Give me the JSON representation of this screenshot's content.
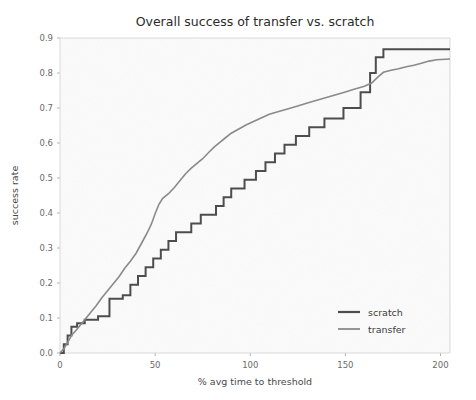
{
  "chart_data": {
    "type": "line",
    "title": "Overall success of transfer vs. scratch",
    "xlabel": "% avg time to threshold",
    "ylabel": "success rate",
    "xlim": [
      0,
      205
    ],
    "ylim": [
      0.0,
      0.9
    ],
    "xticks": [
      0,
      50,
      100,
      150,
      200
    ],
    "xtick_labels": [
      "0",
      "50",
      "100",
      "150",
      "200"
    ],
    "yticks": [
      0.0,
      0.1,
      0.2,
      0.3,
      0.4,
      0.5,
      0.6,
      0.7,
      0.8,
      0.9
    ],
    "ytick_labels": [
      "0.0",
      "0.1",
      "0.2",
      "0.3",
      "0.4",
      "0.5",
      "0.6",
      "0.7",
      "0.8",
      "0.9"
    ],
    "grid": false,
    "legend_position": "lower right",
    "series": [
      {
        "name": "scratch",
        "color": "#4d4d4d",
        "width": 2.0,
        "step": true,
        "points": [
          [
            0,
            0.0
          ],
          [
            2,
            0.0
          ],
          [
            2,
            0.025
          ],
          [
            4,
            0.025
          ],
          [
            4,
            0.05
          ],
          [
            6,
            0.05
          ],
          [
            6,
            0.075
          ],
          [
            9,
            0.075
          ],
          [
            9,
            0.085
          ],
          [
            13,
            0.085
          ],
          [
            13,
            0.095
          ],
          [
            20,
            0.095
          ],
          [
            20,
            0.105
          ],
          [
            26,
            0.105
          ],
          [
            26,
            0.155
          ],
          [
            33,
            0.155
          ],
          [
            33,
            0.165
          ],
          [
            37,
            0.165
          ],
          [
            37,
            0.195
          ],
          [
            41,
            0.195
          ],
          [
            41,
            0.22
          ],
          [
            45,
            0.22
          ],
          [
            45,
            0.245
          ],
          [
            49,
            0.245
          ],
          [
            49,
            0.27
          ],
          [
            53,
            0.27
          ],
          [
            53,
            0.295
          ],
          [
            57,
            0.295
          ],
          [
            57,
            0.32
          ],
          [
            61,
            0.32
          ],
          [
            61,
            0.345
          ],
          [
            69,
            0.345
          ],
          [
            69,
            0.37
          ],
          [
            74,
            0.37
          ],
          [
            74,
            0.395
          ],
          [
            82,
            0.395
          ],
          [
            82,
            0.42
          ],
          [
            86,
            0.42
          ],
          [
            86,
            0.445
          ],
          [
            90,
            0.445
          ],
          [
            90,
            0.47
          ],
          [
            97,
            0.47
          ],
          [
            97,
            0.495
          ],
          [
            103,
            0.495
          ],
          [
            103,
            0.52
          ],
          [
            108,
            0.52
          ],
          [
            108,
            0.545
          ],
          [
            113,
            0.545
          ],
          [
            113,
            0.57
          ],
          [
            118,
            0.57
          ],
          [
            118,
            0.595
          ],
          [
            124,
            0.595
          ],
          [
            124,
            0.62
          ],
          [
            131,
            0.62
          ],
          [
            131,
            0.645
          ],
          [
            139,
            0.645
          ],
          [
            139,
            0.67
          ],
          [
            149,
            0.67
          ],
          [
            149,
            0.7
          ],
          [
            158,
            0.7
          ],
          [
            158,
            0.745
          ],
          [
            163,
            0.745
          ],
          [
            163,
            0.8
          ],
          [
            166,
            0.8
          ],
          [
            166,
            0.845
          ],
          [
            170,
            0.845
          ],
          [
            170,
            0.868
          ],
          [
            205,
            0.868
          ]
        ]
      },
      {
        "name": "transfer",
        "color": "#8a8a8a",
        "width": 1.6,
        "step": false,
        "points": [
          [
            0,
            0.0
          ],
          [
            2,
            0.012
          ],
          [
            4,
            0.03
          ],
          [
            6,
            0.05
          ],
          [
            8,
            0.062
          ],
          [
            10,
            0.075
          ],
          [
            13,
            0.095
          ],
          [
            16,
            0.115
          ],
          [
            19,
            0.135
          ],
          [
            22,
            0.158
          ],
          [
            25,
            0.178
          ],
          [
            28,
            0.198
          ],
          [
            31,
            0.218
          ],
          [
            34,
            0.242
          ],
          [
            37,
            0.262
          ],
          [
            40,
            0.285
          ],
          [
            42,
            0.305
          ],
          [
            44,
            0.325
          ],
          [
            46,
            0.345
          ],
          [
            48,
            0.368
          ],
          [
            50,
            0.398
          ],
          [
            52,
            0.425
          ],
          [
            54,
            0.442
          ],
          [
            57,
            0.455
          ],
          [
            60,
            0.472
          ],
          [
            63,
            0.492
          ],
          [
            66,
            0.512
          ],
          [
            69,
            0.528
          ],
          [
            72,
            0.542
          ],
          [
            75,
            0.555
          ],
          [
            78,
            0.572
          ],
          [
            81,
            0.588
          ],
          [
            84,
            0.602
          ],
          [
            87,
            0.615
          ],
          [
            90,
            0.628
          ],
          [
            94,
            0.64
          ],
          [
            98,
            0.652
          ],
          [
            102,
            0.662
          ],
          [
            106,
            0.672
          ],
          [
            110,
            0.682
          ],
          [
            115,
            0.69
          ],
          [
            120,
            0.698
          ],
          [
            125,
            0.706
          ],
          [
            130,
            0.714
          ],
          [
            135,
            0.722
          ],
          [
            140,
            0.73
          ],
          [
            145,
            0.738
          ],
          [
            150,
            0.746
          ],
          [
            155,
            0.754
          ],
          [
            160,
            0.762
          ],
          [
            164,
            0.772
          ],
          [
            167,
            0.788
          ],
          [
            170,
            0.802
          ],
          [
            174,
            0.808
          ],
          [
            178,
            0.812
          ],
          [
            182,
            0.818
          ],
          [
            186,
            0.822
          ],
          [
            190,
            0.828
          ],
          [
            194,
            0.834
          ],
          [
            198,
            0.838
          ],
          [
            205,
            0.84
          ]
        ]
      }
    ]
  },
  "legend": {
    "items": [
      {
        "label": "scratch",
        "color": "#4d4d4d"
      },
      {
        "label": "transfer",
        "color": "#8a8a8a"
      }
    ]
  }
}
